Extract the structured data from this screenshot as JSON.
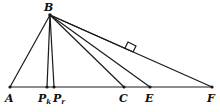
{
  "diagram": {
    "type": "geometry",
    "points": {
      "B": {
        "label": "B",
        "x": 50,
        "y": 15
      },
      "A": {
        "label": "A",
        "x": 10,
        "y": 87
      },
      "Pk": {
        "label": "P",
        "sub": "k",
        "x": 47,
        "y": 87
      },
      "Pr": {
        "label": "P",
        "sub": "r",
        "x": 54,
        "y": 87
      },
      "C": {
        "label": "C",
        "x": 124,
        "y": 87
      },
      "E": {
        "label": "E",
        "x": 150,
        "y": 87
      },
      "F": {
        "label": "F",
        "x": 212,
        "y": 87
      }
    },
    "segments": [
      "AF",
      "BA",
      "BPk",
      "BPr",
      "BC",
      "BE",
      "BF",
      "BH"
    ],
    "right_angle_marker": "on segment from B meeting BF side near (133,50)"
  }
}
